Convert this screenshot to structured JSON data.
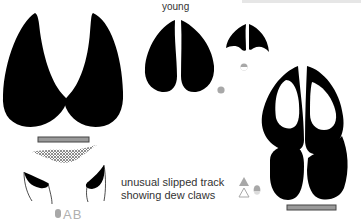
{
  "figure": {
    "labels": {
      "young": "young",
      "caption_line1": "unusual slipped track",
      "caption_line2": "showing dew claws",
      "ab_marker": "AB"
    },
    "colors": {
      "print": "#000000",
      "scale_bar_fill": "#9a9a9a",
      "scale_bar_border": "#555555",
      "marker_grey": "#a8a8a8",
      "background": "#ffffff"
    },
    "elements": [
      "large adult hoofprint (two toes)",
      "scale bar under adult print",
      "slipped track with dew claws",
      "young hoofprint (medium)",
      "young hoofprint (small)",
      "hind print overlapping fore print",
      "scale bar under overlapping prints"
    ],
    "markers": [
      {
        "id": "marker-young-medium",
        "shape": "circle",
        "color": "#a8a8a8"
      },
      {
        "id": "marker-young-small",
        "shape": "half-circle",
        "color": "#a8a8a8"
      },
      {
        "id": "marker-overlap",
        "shape": "triangles-and-circle",
        "color": "#a8a8a8"
      },
      {
        "id": "marker-ab",
        "shape": "pill",
        "color": "#a8a8a8"
      }
    ]
  }
}
